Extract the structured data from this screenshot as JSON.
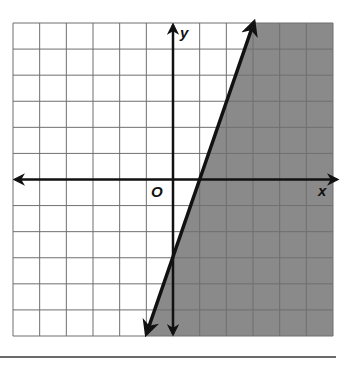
{
  "labels": {
    "x_axis": "x",
    "y_axis": "y",
    "origin": "O"
  },
  "colors": {
    "shade": "#8a8a8a",
    "grid": "#6f6f6f",
    "axis": "#111111",
    "boundary": "#111111",
    "background": "#ffffff"
  },
  "chart_data": {
    "type": "line",
    "title": "",
    "xlabel": "x",
    "ylabel": "y",
    "xlim": [
      -6,
      6
    ],
    "ylim": [
      -6,
      6
    ],
    "grid": true,
    "grid_step": 1,
    "series": [
      {
        "name": "boundary line y = 3x - 3",
        "style": "solid",
        "slope": 3,
        "intercept": -3,
        "points": [
          [
            -1,
            -6
          ],
          [
            0,
            -3
          ],
          [
            1,
            0
          ],
          [
            2,
            3
          ],
          [
            3,
            6
          ]
        ]
      }
    ],
    "shaded_region": "right of/below line (y <= 3x - 3)",
    "inequality": "y <= 3x - 3",
    "annotations": [
      "O"
    ]
  }
}
